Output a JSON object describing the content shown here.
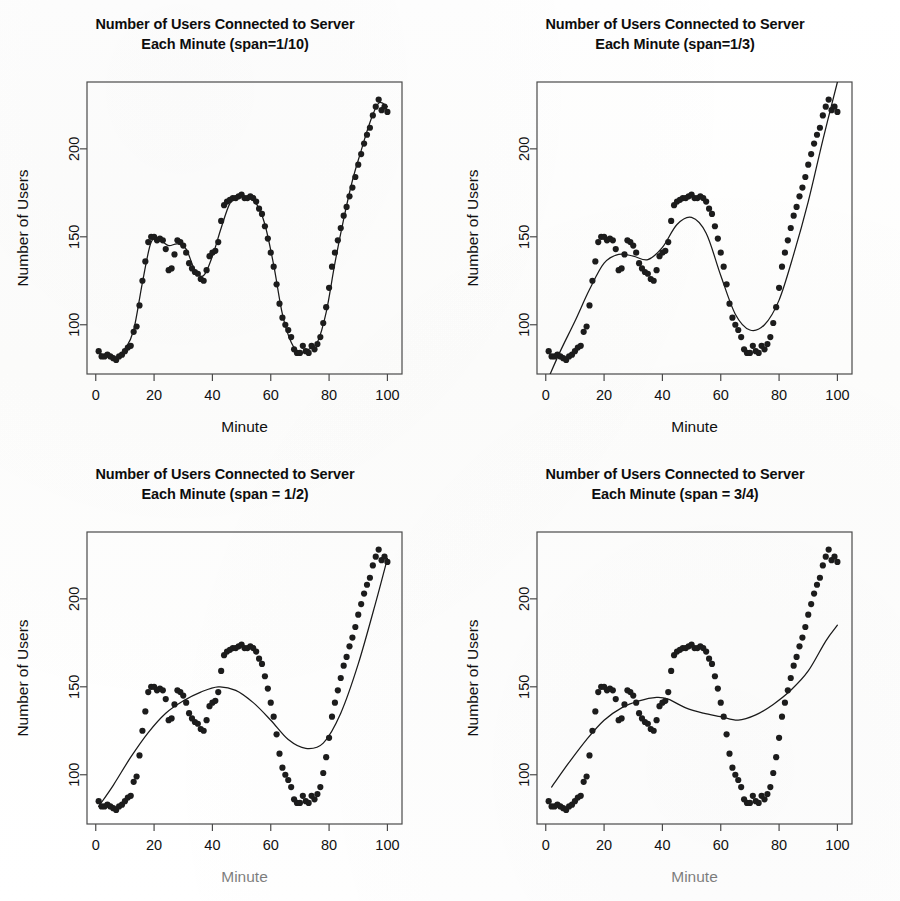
{
  "figure": {
    "background_color": "#ffffff",
    "ink_color": "#1a1a1a",
    "layout": "2x2 grid of scatter plots with LOESS smoothers"
  },
  "panels": [
    {
      "id": "panel-span-1-10",
      "title_line1": "Number of Users Connected to Server",
      "title_line2": "Each Minute (span=1/10)",
      "xlabel": "Minute",
      "ylabel": "Number of Users",
      "span_label": "span=1/10",
      "xlabel_faded": false
    },
    {
      "id": "panel-span-1-3",
      "title_line1": "Number of Users Connected to Server",
      "title_line2": "Each Minute (span=1/3)",
      "xlabel": "Minute",
      "ylabel": "Number of Users",
      "span_label": "span=1/3",
      "xlabel_faded": false
    },
    {
      "id": "panel-span-1-2",
      "title_line1": "Number of Users Connected to Server",
      "title_line2": "Each Minute (span = 1/2)",
      "xlabel": "Minute",
      "ylabel": "Number of Users",
      "span_label": "span = 1/2",
      "xlabel_faded": true
    },
    {
      "id": "panel-span-3-4",
      "title_line1": "Number of Users Connected to Server",
      "title_line2": "Each Minute (span = 3/4)",
      "xlabel": "Minute",
      "ylabel": "Number of Users",
      "span_label": "span = 3/4",
      "xlabel_faded": true
    }
  ],
  "chart_data": [
    {
      "type": "scatter",
      "title": "Number of Users Connected to Server Each Minute (span=1/10)",
      "xlabel": "Minute",
      "ylabel": "Number of Users",
      "xlim": [
        -3,
        105
      ],
      "ylim": [
        72,
        238
      ],
      "xticks": [
        0,
        20,
        40,
        60,
        80,
        100
      ],
      "yticks": [
        100,
        150,
        200
      ],
      "grid": false,
      "legend": "none",
      "x": [
        1,
        2,
        3,
        4,
        5,
        6,
        7,
        8,
        9,
        10,
        11,
        12,
        13,
        14,
        15,
        16,
        17,
        18,
        19,
        20,
        21,
        22,
        23,
        24,
        25,
        26,
        27,
        28,
        29,
        30,
        31,
        32,
        33,
        34,
        35,
        36,
        37,
        38,
        39,
        40,
        41,
        42,
        43,
        44,
        45,
        46,
        47,
        48,
        49,
        50,
        51,
        52,
        53,
        54,
        55,
        56,
        57,
        58,
        59,
        60,
        61,
        62,
        63,
        64,
        65,
        66,
        67,
        68,
        69,
        70,
        71,
        72,
        73,
        74,
        75,
        76,
        77,
        78,
        79,
        80,
        81,
        82,
        83,
        84,
        85,
        86,
        87,
        88,
        89,
        90,
        91,
        92,
        93,
        94,
        95,
        96,
        97,
        98,
        99,
        100
      ],
      "y": [
        85,
        82,
        82,
        83,
        82,
        81,
        80,
        82,
        83,
        85,
        87,
        88,
        96,
        99,
        111,
        125,
        136,
        147,
        150,
        150,
        148,
        149,
        148,
        143,
        131,
        132,
        140,
        148,
        147,
        145,
        141,
        135,
        132,
        130,
        129,
        126,
        125,
        131,
        139,
        141,
        142,
        147,
        159,
        168,
        170,
        171,
        172,
        172,
        173,
        174,
        172,
        172,
        173,
        172,
        170,
        166,
        163,
        156,
        149,
        141,
        133,
        123,
        112,
        104,
        100,
        97,
        93,
        86,
        84,
        84,
        88,
        85,
        84,
        88,
        86,
        89,
        93,
        101,
        110,
        121,
        133,
        141,
        148,
        155,
        162,
        167,
        173,
        178,
        184,
        191,
        197,
        203,
        208,
        212,
        219,
        224,
        228,
        222,
        224,
        221
      ],
      "series": [
        {
          "name": "observed counts",
          "marker": "filled circle",
          "color": "#1c1c1c"
        },
        {
          "name": "loess smoother (span=1/10)",
          "type": "line",
          "color": "#1a1a1a",
          "smooth_x": [
            1,
            4,
            7,
            10,
            13,
            16,
            19,
            22,
            25,
            28,
            31,
            34,
            37,
            40,
            43,
            46,
            49,
            52,
            55,
            58,
            61,
            64,
            67,
            70,
            73,
            76,
            79,
            82,
            85,
            88,
            91,
            94,
            97,
            100
          ],
          "smooth_y": [
            84,
            82,
            81,
            86,
            97,
            124,
            147,
            148,
            145,
            146,
            143,
            131,
            128,
            139,
            155,
            169,
            173,
            172,
            169,
            157,
            134,
            106,
            90,
            84,
            86,
            90,
            107,
            135,
            160,
            182,
            199,
            215,
            226,
            224
          ]
        }
      ]
    },
    {
      "type": "scatter",
      "title": "Number of Users Connected to Server Each Minute (span=1/3)",
      "xlabel": "Minute",
      "ylabel": "Number of Users",
      "xlim": [
        -3,
        105
      ],
      "ylim": [
        72,
        238
      ],
      "xticks": [
        0,
        20,
        40,
        60,
        80,
        100
      ],
      "yticks": [
        100,
        150,
        200
      ],
      "grid": false,
      "legend": "none",
      "x": [
        1,
        2,
        3,
        4,
        5,
        6,
        7,
        8,
        9,
        10,
        11,
        12,
        13,
        14,
        15,
        16,
        17,
        18,
        19,
        20,
        21,
        22,
        23,
        24,
        25,
        26,
        27,
        28,
        29,
        30,
        31,
        32,
        33,
        34,
        35,
        36,
        37,
        38,
        39,
        40,
        41,
        42,
        43,
        44,
        45,
        46,
        47,
        48,
        49,
        50,
        51,
        52,
        53,
        54,
        55,
        56,
        57,
        58,
        59,
        60,
        61,
        62,
        63,
        64,
        65,
        66,
        67,
        68,
        69,
        70,
        71,
        72,
        73,
        74,
        75,
        76,
        77,
        78,
        79,
        80,
        81,
        82,
        83,
        84,
        85,
        86,
        87,
        88,
        89,
        90,
        91,
        92,
        93,
        94,
        95,
        96,
        97,
        98,
        99,
        100
      ],
      "y": [
        85,
        82,
        82,
        83,
        82,
        81,
        80,
        82,
        83,
        85,
        87,
        88,
        96,
        99,
        111,
        125,
        136,
        147,
        150,
        150,
        148,
        149,
        148,
        143,
        131,
        132,
        140,
        148,
        147,
        145,
        141,
        135,
        132,
        130,
        129,
        126,
        125,
        131,
        139,
        141,
        142,
        147,
        159,
        168,
        170,
        171,
        172,
        172,
        173,
        174,
        172,
        172,
        173,
        172,
        170,
        166,
        163,
        156,
        149,
        141,
        133,
        123,
        112,
        104,
        100,
        97,
        93,
        86,
        84,
        84,
        88,
        85,
        84,
        88,
        86,
        89,
        93,
        101,
        110,
        121,
        133,
        141,
        148,
        155,
        162,
        167,
        173,
        178,
        184,
        191,
        197,
        203,
        208,
        212,
        219,
        224,
        228,
        222,
        224,
        221
      ],
      "series": [
        {
          "name": "observed counts",
          "marker": "filled circle",
          "color": "#1c1c1c"
        },
        {
          "name": "loess smoother (span=1/3)",
          "type": "line",
          "color": "#1a1a1a",
          "smooth_x": [
            1,
            5,
            10,
            15,
            20,
            25,
            30,
            35,
            40,
            45,
            50,
            55,
            60,
            65,
            70,
            75,
            80,
            85,
            90,
            95,
            100
          ],
          "smooth_y": [
            70,
            85,
            102,
            120,
            135,
            140,
            139,
            137,
            144,
            157,
            161,
            152,
            128,
            106,
            97,
            100,
            114,
            140,
            170,
            205,
            238
          ]
        }
      ]
    },
    {
      "type": "scatter",
      "title": "Number of Users Connected to Server Each Minute (span = 1/2)",
      "xlabel": "Minute",
      "ylabel": "Number of Users",
      "xlim": [
        -3,
        105
      ],
      "ylim": [
        72,
        238
      ],
      "xticks": [
        0,
        20,
        40,
        60,
        80,
        100
      ],
      "yticks": [
        100,
        150,
        200
      ],
      "grid": false,
      "legend": "none",
      "x": [
        1,
        2,
        3,
        4,
        5,
        6,
        7,
        8,
        9,
        10,
        11,
        12,
        13,
        14,
        15,
        16,
        17,
        18,
        19,
        20,
        21,
        22,
        23,
        24,
        25,
        26,
        27,
        28,
        29,
        30,
        31,
        32,
        33,
        34,
        35,
        36,
        37,
        38,
        39,
        40,
        41,
        42,
        43,
        44,
        45,
        46,
        47,
        48,
        49,
        50,
        51,
        52,
        53,
        54,
        55,
        56,
        57,
        58,
        59,
        60,
        61,
        62,
        63,
        64,
        65,
        66,
        67,
        68,
        69,
        70,
        71,
        72,
        73,
        74,
        75,
        76,
        77,
        78,
        79,
        80,
        81,
        82,
        83,
        84,
        85,
        86,
        87,
        88,
        89,
        90,
        91,
        92,
        93,
        94,
        95,
        96,
        97,
        98,
        99,
        100
      ],
      "y": [
        85,
        82,
        82,
        83,
        82,
        81,
        80,
        82,
        83,
        85,
        87,
        88,
        96,
        99,
        111,
        125,
        136,
        147,
        150,
        150,
        148,
        149,
        148,
        143,
        131,
        132,
        140,
        148,
        147,
        145,
        141,
        135,
        132,
        130,
        129,
        126,
        125,
        131,
        139,
        141,
        142,
        147,
        159,
        168,
        170,
        171,
        172,
        172,
        173,
        174,
        172,
        172,
        173,
        172,
        170,
        166,
        163,
        156,
        149,
        141,
        133,
        123,
        112,
        104,
        100,
        97,
        93,
        86,
        84,
        84,
        88,
        85,
        84,
        88,
        86,
        89,
        93,
        101,
        110,
        121,
        133,
        141,
        148,
        155,
        162,
        167,
        173,
        178,
        184,
        191,
        197,
        203,
        208,
        212,
        219,
        224,
        228,
        222,
        224,
        221
      ],
      "series": [
        {
          "name": "observed counts",
          "marker": "filled circle",
          "color": "#1c1c1c"
        },
        {
          "name": "loess smoother (span = 1/2)",
          "type": "line",
          "color": "#1a1a1a",
          "smooth_x": [
            1,
            6,
            12,
            18,
            24,
            30,
            36,
            42,
            48,
            54,
            60,
            66,
            72,
            78,
            84,
            90,
            96,
            100
          ],
          "smooth_y": [
            82,
            94,
            110,
            124,
            135,
            142,
            147,
            150,
            148,
            141,
            131,
            120,
            115,
            118,
            135,
            163,
            198,
            223
          ]
        }
      ]
    },
    {
      "type": "scatter",
      "title": "Number of Users Connected to Server Each Minute (span = 3/4)",
      "xlabel": "Minute",
      "ylabel": "Number of Users",
      "xlim": [
        -3,
        105
      ],
      "ylim": [
        72,
        238
      ],
      "xticks": [
        0,
        20,
        40,
        60,
        80,
        100
      ],
      "yticks": [
        100,
        150,
        200
      ],
      "grid": false,
      "legend": "none",
      "x": [
        1,
        2,
        3,
        4,
        5,
        6,
        7,
        8,
        9,
        10,
        11,
        12,
        13,
        14,
        15,
        16,
        17,
        18,
        19,
        20,
        21,
        22,
        23,
        24,
        25,
        26,
        27,
        28,
        29,
        30,
        31,
        32,
        33,
        34,
        35,
        36,
        37,
        38,
        39,
        40,
        41,
        42,
        43,
        44,
        45,
        46,
        47,
        48,
        49,
        50,
        51,
        52,
        53,
        54,
        55,
        56,
        57,
        58,
        59,
        60,
        61,
        62,
        63,
        64,
        65,
        66,
        67,
        68,
        69,
        70,
        71,
        72,
        73,
        74,
        75,
        76,
        77,
        78,
        79,
        80,
        81,
        82,
        83,
        84,
        85,
        86,
        87,
        88,
        89,
        90,
        91,
        92,
        93,
        94,
        95,
        96,
        97,
        98,
        99,
        100
      ],
      "y": [
        85,
        82,
        82,
        83,
        82,
        81,
        80,
        82,
        83,
        85,
        87,
        88,
        96,
        99,
        111,
        125,
        136,
        147,
        150,
        150,
        148,
        149,
        148,
        143,
        131,
        132,
        140,
        148,
        147,
        145,
        141,
        135,
        132,
        130,
        129,
        126,
        125,
        131,
        139,
        141,
        142,
        147,
        159,
        168,
        170,
        171,
        172,
        172,
        173,
        174,
        172,
        172,
        173,
        172,
        170,
        166,
        163,
        156,
        149,
        141,
        133,
        123,
        112,
        104,
        100,
        97,
        93,
        86,
        84,
        84,
        88,
        85,
        84,
        88,
        86,
        89,
        93,
        101,
        110,
        121,
        133,
        141,
        148,
        155,
        162,
        167,
        173,
        178,
        184,
        191,
        197,
        203,
        208,
        212,
        219,
        224,
        228,
        222,
        224,
        221
      ],
      "series": [
        {
          "name": "observed counts",
          "marker": "filled circle",
          "color": "#1c1c1c"
        },
        {
          "name": "loess smoother (span = 3/4)",
          "type": "line",
          "color": "#1a1a1a",
          "smooth_x": [
            2,
            8,
            14,
            20,
            26,
            32,
            38,
            42,
            48,
            54,
            60,
            66,
            72,
            78,
            84,
            90,
            96,
            100
          ],
          "smooth_y": [
            93,
            107,
            120,
            131,
            138,
            142,
            144,
            143,
            138,
            135,
            133,
            131,
            134,
            140,
            148,
            159,
            176,
            185
          ]
        }
      ]
    }
  ]
}
